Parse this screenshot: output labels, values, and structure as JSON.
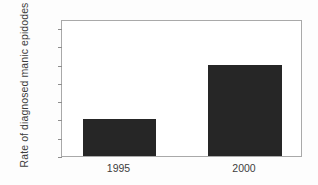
{
  "chart_data": {
    "type": "bar",
    "title": "",
    "xlabel": "",
    "ylabel": "Rate of diagnosed manic epidodes",
    "categories": [
      "1995",
      "2000"
    ],
    "values": [
      0.9,
      1.5
    ],
    "series": [
      {
        "name": "Rate of diagnosed manic epidodes",
        "values": [
          0.9,
          1.5
        ]
      }
    ],
    "ylim": [
      0.5,
      2.0
    ],
    "yticks": [
      "0.5",
      "0.7",
      "0.9",
      "1.1",
      "1.3",
      "1.5",
      "1.7",
      "1.9"
    ],
    "ytick_values": [
      0.5,
      0.7,
      0.9,
      1.1,
      1.3,
      1.5,
      1.7,
      1.9
    ],
    "grid": false,
    "legend": false,
    "legend_position": "none",
    "bar_color": "#262626",
    "frame_color": "#a9a9a9",
    "background_color": "#ffffff",
    "text_color": "#3d3d3d"
  }
}
